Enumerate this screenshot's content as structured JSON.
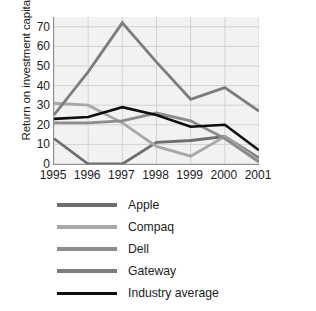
{
  "chart_data": {
    "type": "line",
    "title": "",
    "xlabel": "",
    "ylabel": "Return on investment capital",
    "categories": [
      "1995",
      "1996",
      "1997",
      "1998",
      "1999",
      "2000",
      "2001"
    ],
    "x": [
      1995,
      1996,
      1997,
      1998,
      1999,
      2000,
      2001
    ],
    "ylim": [
      0,
      75
    ],
    "yticks": [
      0,
      10,
      20,
      30,
      40,
      50,
      60,
      70
    ],
    "ytick_labels": [
      "0",
      "10",
      "20",
      "30",
      "40",
      "50",
      "60",
      "70"
    ],
    "grid": true,
    "legend_position": "below",
    "series": [
      {
        "name": "Apple",
        "color": "#6e6e6e",
        "values": [
          13,
          0,
          0,
          11,
          12,
          14,
          3
        ]
      },
      {
        "name": "Compaq",
        "color": "#a8a8a8",
        "values": [
          31,
          30,
          21,
          9,
          4,
          14,
          2
        ]
      },
      {
        "name": "Dell",
        "color": "#8c8c8c",
        "values": [
          21,
          21,
          22,
          26,
          22,
          13,
          1
        ]
      },
      {
        "name": "Gateway",
        "color": "#7d7d7d",
        "values": [
          25,
          47,
          72,
          52,
          33,
          39,
          27
        ]
      },
      {
        "name": "Industry average",
        "color": "#0d0d0d",
        "values": [
          23,
          24,
          29,
          25,
          19,
          20,
          7
        ]
      }
    ],
    "colors": {
      "plot_background": "#f2f2f2",
      "grid": "#d2d2d2",
      "axis": "#8e8e8e",
      "text": "#1c1c1c",
      "page_background": "#ffffff"
    }
  }
}
